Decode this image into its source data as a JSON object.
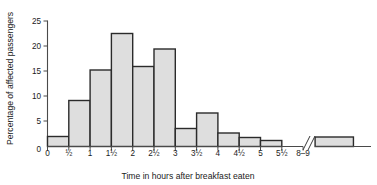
{
  "chart_data": {
    "type": "bar",
    "title": "",
    "subtitle": "",
    "xlabel": "Time in hours after breakfast eaten",
    "ylabel": "Percentage of affected passengers",
    "categories": [
      "0–½",
      "½–1",
      "1–1½",
      "1½–2",
      "2–2½",
      "2½–3",
      "3–3½",
      "3½–4",
      "4–4½",
      "4½–5",
      "5–5½",
      "8–9"
    ],
    "values": [
      2.0,
      9.2,
      15.3,
      22.6,
      16.0,
      19.5,
      3.6,
      6.7,
      2.7,
      1.8,
      1.2,
      1.9
    ],
    "bin_edges": [
      0,
      0.5,
      1,
      1.5,
      2,
      2.5,
      3,
      3.5,
      4,
      4.5,
      5,
      5.5
    ],
    "xtick_labels": [
      "0",
      "½",
      "1",
      "1½",
      "2",
      "2½",
      "3",
      "3½",
      "4",
      "4½",
      "5",
      "5½",
      "8–9"
    ],
    "ytick_labels": [
      "0",
      "5",
      "10",
      "15",
      "20",
      "25"
    ],
    "ytick_values": [
      0,
      5,
      10,
      15,
      20,
      25
    ],
    "ylim": [
      0,
      25
    ],
    "grid": false,
    "legend": "none",
    "axis_break": true,
    "axis_break_note": "x-axis break between 5½ and 8",
    "bar_fill_color": "#dedede",
    "bar_edge_color": "#2b2b2b",
    "axis_color": "#4a4a4a",
    "background_color": "#ffffff"
  }
}
